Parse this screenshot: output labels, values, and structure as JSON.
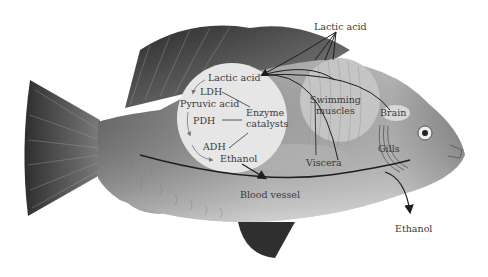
{
  "diagram": {
    "labels": {
      "lactic_acid_top": "Lactic acid",
      "lactic_acid_circle": "Lactic acid",
      "ldh": "LDH",
      "pyruvic_acid": "Pyruvic acid",
      "pdh": "PDH",
      "adh": "ADH",
      "ethanol_circle": "Ethanol",
      "enzyme_line1": "Enzyme",
      "enzyme_line2": "catalysts",
      "swimming_line1": "Swimming",
      "swimming_line2": "muscles",
      "brain": "Brain",
      "gills": "Gills",
      "viscera": "Viscera",
      "blood_vessel": "Blood vessel",
      "ethanol_out": "Ethanol"
    },
    "pathway": [
      "Lactic acid",
      "LDH",
      "Pyruvic acid",
      "PDH",
      "ADH",
      "Ethanol"
    ],
    "colors": {
      "background": "#ffffff",
      "circle_fill": "#e6e6e6",
      "fin_dark": "#3c3c3c",
      "body_mid": "#9a9a9a",
      "text": "#3a3a3a",
      "arrow": "#1e1e1e"
    }
  }
}
